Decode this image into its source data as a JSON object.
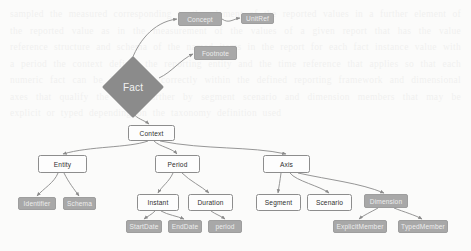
{
  "diagram": {
    "colors": {
      "background": "#fbfbfa",
      "class_node_fill": "#fdfdfd",
      "class_node_stroke": "#8d8d8d",
      "attribute_node_fill": "#a8a8a8",
      "attribute_node_text": "#ededed",
      "diamond_fill": "#8b8b8b",
      "edge_stroke": "#8a8a8a",
      "class_node_text": "#2f2f2f"
    },
    "nodes": [
      {
        "id": "fact",
        "label": "Fact",
        "shape": "diamond",
        "style": "diamond",
        "x": 102,
        "y": 56,
        "w": 62,
        "h": 62
      },
      {
        "id": "concept",
        "label": "Concept",
        "shape": "rect",
        "style": "gray",
        "x": 178,
        "y": 12,
        "w": 44,
        "h": 14
      },
      {
        "id": "unitref",
        "label": "UnitRef",
        "shape": "rect",
        "style": "gray",
        "x": 241,
        "y": 13,
        "w": 33,
        "h": 11
      },
      {
        "id": "footnote",
        "label": "Footnote",
        "shape": "rect",
        "style": "gray",
        "x": 194,
        "y": 46,
        "w": 43,
        "h": 14
      },
      {
        "id": "context",
        "label": "Context",
        "shape": "rect",
        "style": "white",
        "x": 128,
        "y": 125,
        "w": 47,
        "h": 16
      },
      {
        "id": "entity",
        "label": "Entity",
        "shape": "rect",
        "style": "white",
        "x": 38,
        "y": 155,
        "w": 49,
        "h": 18
      },
      {
        "id": "period",
        "label": "Period",
        "shape": "rect",
        "style": "white",
        "x": 155,
        "y": 155,
        "w": 45,
        "h": 18
      },
      {
        "id": "axis",
        "label": "Axis",
        "shape": "rect",
        "style": "white",
        "x": 263,
        "y": 155,
        "w": 47,
        "h": 18
      },
      {
        "id": "identifier",
        "label": "Identifier",
        "shape": "rect",
        "style": "gray",
        "x": 18,
        "y": 197,
        "w": 38,
        "h": 13
      },
      {
        "id": "schema",
        "label": "Schema",
        "shape": "rect",
        "style": "gray",
        "x": 63,
        "y": 197,
        "w": 33,
        "h": 13
      },
      {
        "id": "instant",
        "label": "Instant",
        "shape": "rect",
        "style": "white",
        "x": 137,
        "y": 194,
        "w": 42,
        "h": 17
      },
      {
        "id": "duration",
        "label": "Duration",
        "shape": "rect",
        "style": "white",
        "x": 188,
        "y": 194,
        "w": 45,
        "h": 17
      },
      {
        "id": "startdate",
        "label": "StartDate",
        "shape": "rect",
        "style": "gray",
        "x": 126,
        "y": 220,
        "w": 36,
        "h": 13
      },
      {
        "id": "enddate",
        "label": "EndDate",
        "shape": "rect",
        "style": "gray",
        "x": 168,
        "y": 220,
        "w": 34,
        "h": 13
      },
      {
        "id": "period_attr",
        "label": "period",
        "shape": "rect",
        "style": "gray",
        "x": 208,
        "y": 220,
        "w": 34,
        "h": 13
      },
      {
        "id": "segment",
        "label": "Segment",
        "shape": "rect",
        "style": "white",
        "x": 256,
        "y": 194,
        "w": 45,
        "h": 17
      },
      {
        "id": "scenario",
        "label": "Scenario",
        "shape": "rect",
        "style": "white",
        "x": 307,
        "y": 194,
        "w": 45,
        "h": 17
      },
      {
        "id": "dimension",
        "label": "Dimension",
        "shape": "rect",
        "style": "gray",
        "x": 364,
        "y": 194,
        "w": 44,
        "h": 14
      },
      {
        "id": "explicitmember",
        "label": "ExplicitMember",
        "shape": "rect",
        "style": "gray",
        "x": 333,
        "y": 220,
        "w": 54,
        "h": 13
      },
      {
        "id": "typedmember",
        "label": "TypedMember",
        "shape": "rect",
        "style": "gray",
        "x": 398,
        "y": 220,
        "w": 50,
        "h": 13
      }
    ],
    "edges": [
      {
        "from": "fact",
        "to": "concept",
        "path": "M 131 62 C 137 44, 152 22, 177 19",
        "arrow": true
      },
      {
        "from": "concept",
        "to": "unitref",
        "path": "M 222 19 C 229 24, 233 19, 240 18",
        "arrow": true
      },
      {
        "from": "fact",
        "to": "footnote",
        "path": "M 159 78 C 172 72, 180 60, 193 54",
        "arrow": true
      },
      {
        "from": "fact",
        "to": "context",
        "path": "M 133 113 C 137 119, 144 120, 149 124",
        "arrow": true
      },
      {
        "from": "context",
        "to": "entity",
        "path": "M 148 141 C 128 148, 90 146, 63 154",
        "arrow": true
      },
      {
        "from": "context",
        "to": "period",
        "path": "M 154 141 C 160 147, 172 148, 177 154",
        "arrow": true
      },
      {
        "from": "context",
        "to": "axis",
        "path": "M 160 141 C 205 150, 250 146, 286 154",
        "arrow": true
      },
      {
        "from": "entity",
        "to": "identifier",
        "path": "M 58 173 C 54 183, 44 188, 37 196",
        "arrow": true
      },
      {
        "from": "entity",
        "to": "schema",
        "path": "M 64 173 C 69 183, 74 189, 79 196",
        "arrow": true
      },
      {
        "from": "period",
        "to": "instant",
        "path": "M 173 173 C 169 182, 162 186, 158 193",
        "arrow": true
      },
      {
        "from": "period",
        "to": "duration",
        "path": "M 182 173 C 190 181, 201 186, 209 193",
        "arrow": true
      },
      {
        "from": "instant",
        "to": "startdate",
        "path": "M 155 211 C 151 215, 148 216, 144 219",
        "arrow": true
      },
      {
        "from": "instant",
        "to": "enddate",
        "path": "M 161 211 C 168 215, 177 216, 184 219",
        "arrow": true
      },
      {
        "from": "duration",
        "to": "period_attr",
        "path": "M 211 211 C 215 214, 221 216, 225 219",
        "arrow": true
      },
      {
        "from": "axis",
        "to": "segment",
        "path": "M 281 173 C 280 181, 279 186, 278 193",
        "arrow": true
      },
      {
        "from": "axis",
        "to": "scenario",
        "path": "M 290 173 C 296 181, 320 186, 329 193",
        "arrow": true
      },
      {
        "from": "axis",
        "to": "dimension",
        "path": "M 298 173 C 330 180, 360 183, 384 193",
        "arrow": true
      },
      {
        "from": "dimension",
        "to": "explicitmember",
        "path": "M 378 208 C 371 212, 364 215, 359 219",
        "arrow": true
      },
      {
        "from": "dimension",
        "to": "typedmember",
        "path": "M 394 208 C 404 212, 415 215, 422 219",
        "arrow": true
      }
    ]
  },
  "ghost_text": "sampled the measured corresponding to the element of the reported values in a further element of the reported value as in the measurement of the values of a given report that has the value reference structure and schema of the named items in the report for each fact instance value with a period the context defines the reporting entity and the time reference that applies so that each numeric fact can be interpreted correctly within the defined reporting framework and dimensional axes that qualify the value further by segment scenario and dimension members that may be explicit or typed depending on the taxonomy definition used"
}
